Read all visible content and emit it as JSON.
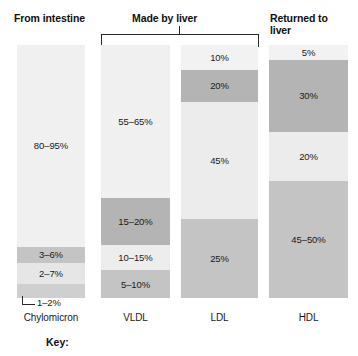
{
  "headers": {
    "from_intestine": "From intestine",
    "made_by_liver": "Made by liver",
    "returned_to_liver": "Returned to\nliver"
  },
  "key": {
    "label": "Key:"
  },
  "callout": {
    "value": "1–2%"
  },
  "palette": {
    "lightest": "#f2f2f2",
    "light": "#e8e8e8",
    "medium_light": "#dcdcdc",
    "medium": "#c9c9c9",
    "dark": "#a8a8a8",
    "text": "#1a1a1a",
    "rule": "#2b2b2b",
    "background": "#ffffff"
  },
  "chart_data": {
    "type": "bar",
    "title": "",
    "subtitle": "",
    "xlabel": "",
    "ylabel": "",
    "ylim": [
      0,
      100
    ],
    "grid": false,
    "legend_position": "bottom",
    "orientation": "vertical-stacked",
    "categories": [
      "Chylomicron",
      "VLDL",
      "LDL",
      "HDL"
    ],
    "group_labels": [
      {
        "label": "From intestine",
        "columns": [
          "Chylomicron"
        ],
        "bracket": false
      },
      {
        "label": "Made by liver",
        "columns": [
          "VLDL",
          "LDL"
        ],
        "bracket": true
      },
      {
        "label": "Returned to liver",
        "columns": [
          "HDL"
        ],
        "bracket": false
      }
    ],
    "columns": [
      {
        "name": "Chylomicron",
        "segments": [
          {
            "label": "80–95%",
            "value": 87.5,
            "pixel_share": 79.8,
            "color": "#f0f0f0"
          },
          {
            "label": "3–6%",
            "value": 4.5,
            "pixel_share": 6.3,
            "color": "#c4c4c4"
          },
          {
            "label": "2–7%",
            "value": 4.5,
            "pixel_share": 8.3,
            "color": "#e6e6e6"
          },
          {
            "label": "1–2%",
            "value": 1.5,
            "pixel_share": 5.6,
            "color": "#cfcfcf",
            "label_external": true
          }
        ]
      },
      {
        "name": "VLDL",
        "segments": [
          {
            "label": "55–65%",
            "value": 60.0,
            "pixel_share": 60.5,
            "color": "#f0f0f0"
          },
          {
            "label": "15–20%",
            "value": 17.5,
            "pixel_share": 18.6,
            "color": "#b4b4b4"
          },
          {
            "label": "10–15%",
            "value": 12.5,
            "pixel_share": 9.9,
            "color": "#ededed"
          },
          {
            "label": "5–10%",
            "value": 7.5,
            "pixel_share": 11.0,
            "color": "#c4c4c4"
          }
        ]
      },
      {
        "name": "LDL",
        "segments": [
          {
            "label": "10%",
            "value": 10.0,
            "pixel_share": 9.9,
            "color": "#f2f2f2"
          },
          {
            "label": "20%",
            "value": 20.0,
            "pixel_share": 12.6,
            "color": "#b4b4b4"
          },
          {
            "label": "45%",
            "value": 45.0,
            "pixel_share": 46.2,
            "color": "#ececec"
          },
          {
            "label": "25%",
            "value": 25.0,
            "pixel_share": 31.3,
            "color": "#c4c4c4"
          }
        ]
      },
      {
        "name": "HDL",
        "segments": [
          {
            "label": "5%",
            "value": 5.0,
            "pixel_share": 5.9,
            "color": "#f2f2f2"
          },
          {
            "label": "30%",
            "value": 30.0,
            "pixel_share": 28.5,
            "color": "#b4b4b4"
          },
          {
            "label": "20%",
            "value": 20.0,
            "pixel_share": 19.4,
            "color": "#ececec"
          },
          {
            "label": "45–50%",
            "value": 47.5,
            "pixel_share": 46.2,
            "color": "#c4c4c4"
          }
        ]
      }
    ]
  }
}
